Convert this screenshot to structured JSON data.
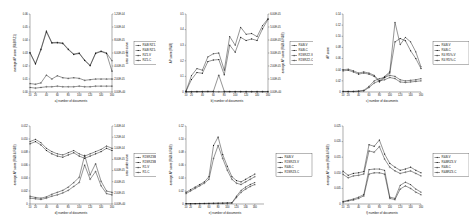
{
  "figure": {
    "layout": "2 rows x 3 columns of line plots",
    "rows": 2,
    "cols": 3
  },
  "common": {
    "xlabel_text": "number of documents",
    "xticks": [
      "10",
      "20",
      "40",
      "60",
      "80",
      "100",
      "120",
      "140",
      "160"
    ],
    "marker_colors": [
      "#111111",
      "#111111",
      "#111111",
      "#111111"
    ]
  },
  "chart_data": [
    {
      "id": "panel-a",
      "type": "line",
      "title": "",
      "caption": "a) number of documents",
      "xlabel": "a) number of documents",
      "ylabel": "average AP score (R&B RZ1)",
      "ylabel_right": "area under curve",
      "xlim": [
        10,
        160
      ],
      "ylim": [
        0,
        0.06
      ],
      "ylim_right": [
        0.0,
        0.00012
      ],
      "yticks": [
        "0.00",
        "0.01",
        "0.02",
        "0.03",
        "0.04",
        "0.05",
        "0.06"
      ],
      "yticks_right": [
        "0.00E+00",
        "2.00E-05",
        "4.00E-05",
        "6.00E-05",
        "8.00E-05",
        "1.00E-04",
        "1.20E-04"
      ],
      "grid": false,
      "legend_position": "right",
      "x": [
        10,
        20,
        30,
        40,
        50,
        60,
        70,
        80,
        90,
        100,
        110,
        120,
        130,
        140,
        150,
        160
      ],
      "series": [
        {
          "name": "R&B RZ1-V",
          "axis": "left",
          "values": [
            0.0305,
            0.0218,
            0.033,
            0.047,
            0.038,
            0.0382,
            0.0377,
            0.033,
            0.0292,
            0.03,
            0.0245,
            0.0205,
            0.03,
            0.0315,
            0.03,
            0.024
          ]
        },
        {
          "name": "R&B RZ1-C",
          "axis": "left",
          "values": [
            0.03,
            0.0215,
            0.0325,
            0.0462,
            0.0376,
            0.0378,
            0.0372,
            0.0326,
            0.0288,
            0.0296,
            0.0242,
            0.0202,
            0.0296,
            0.0311,
            0.0296,
            0.016
          ]
        },
        {
          "name": "RZ1-V",
          "axis": "right",
          "values": [
            1.3e-05,
            1.2e-05,
            1.4e-05,
            2.6e-05,
            2e-05,
            2.5e-05,
            2.2e-05,
            2.1e-05,
            2.2e-05,
            2.1e-05,
            1.8e-05,
            1.9e-05,
            2e-05,
            2e-05,
            2e-05,
            2e-05
          ]
        },
        {
          "name": "RZ1-C",
          "axis": "right",
          "values": [
            7e-06,
            6e-06,
            7e-06,
            8e-06,
            8e-06,
            9e-06,
            8e-06,
            8e-06,
            8e-06,
            9e-06,
            8e-06,
            8e-06,
            9e-06,
            9e-06,
            9e-06,
            9e-06
          ]
        }
      ]
    },
    {
      "id": "panel-b",
      "type": "line",
      "title": "",
      "caption": "b) number of documents",
      "xlabel": "b) number of documents",
      "ylabel": "AP score (R&B)",
      "ylabel_right": "average AP score (R&B & R&B)",
      "xlim": [
        10,
        160
      ],
      "ylim": [
        0,
        0.5
      ],
      "ylim_right": [
        0.0,
        6e-05
      ],
      "yticks": [
        "0",
        "0.1",
        "0.2",
        "0.3",
        "0.4",
        "0.5"
      ],
      "yticks_right": [
        "0.00E+00",
        "1.00E-05",
        "2.00E-05",
        "3.00E-05",
        "4.00E-05",
        "5.00E-05",
        "6.00E-05"
      ],
      "grid": false,
      "legend_position": "right",
      "x": [
        10,
        20,
        30,
        40,
        50,
        60,
        70,
        80,
        90,
        100,
        110,
        120,
        130,
        140,
        150,
        160
      ],
      "series": [
        {
          "name": "R&B-V",
          "axis": "left",
          "values": [
            0.005,
            0.105,
            0.15,
            0.14,
            0.225,
            0.245,
            0.25,
            0.14,
            0.355,
            0.3,
            0.415,
            0.37,
            0.375,
            0.355,
            0.425,
            0.47
          ]
        },
        {
          "name": "R&B-C",
          "axis": "left",
          "values": [
            0.005,
            0.08,
            0.125,
            0.12,
            0.195,
            0.205,
            0.208,
            0.11,
            0.3,
            0.255,
            0.35,
            0.33,
            0.34,
            0.33,
            0.405,
            0.465
          ]
        },
        {
          "name": "R1SRZ2-V",
          "axis": "right",
          "values": [
            2e-07,
            3e-07,
            4e-07,
            4e-07,
            5e-07,
            5e-07,
            1.3e-05,
            5e-07,
            4e-07,
            4e-07,
            4e-07,
            4e-07,
            4e-07,
            4e-07,
            4e-07,
            4e-07
          ]
        },
        {
          "name": "R1SRZ2-C",
          "axis": "right",
          "values": [
            1e-07,
            2e-07,
            2e-07,
            2e-07,
            3e-07,
            3e-07,
            2e-07,
            2e-07,
            2e-07,
            2e-07,
            2e-07,
            2e-07,
            2e-07,
            2e-07,
            2e-07,
            2e-07
          ]
        }
      ]
    },
    {
      "id": "panel-c",
      "type": "line",
      "title": "",
      "caption": "c) number of documents",
      "xlabel": "c) number of documents",
      "ylabel": "AP score",
      "xlim": [
        10,
        160
      ],
      "ylim": [
        0,
        0.14
      ],
      "yticks": [
        "0",
        "0.02",
        "0.04",
        "0.06",
        "0.08",
        "0.10",
        "0.12",
        "0.14"
      ],
      "grid": false,
      "legend_position": "right",
      "x": [
        10,
        20,
        30,
        40,
        50,
        60,
        70,
        80,
        90,
        100,
        110,
        120,
        130,
        140,
        150,
        160
      ],
      "series": [
        {
          "name": "R&B-V",
          "axis": "left",
          "values": [
            0.04,
            0.041,
            0.038,
            0.034,
            0.036,
            0.034,
            0.03,
            0.02,
            0.028,
            0.036,
            0.125,
            0.085,
            0.098,
            0.09,
            0.072,
            0.045
          ]
        },
        {
          "name": "R&B-C",
          "axis": "left",
          "values": [
            0.038,
            0.039,
            0.036,
            0.032,
            0.034,
            0.032,
            0.028,
            0.018,
            0.026,
            0.034,
            0.09,
            0.096,
            0.092,
            0.074,
            0.06,
            0.042
          ]
        },
        {
          "name": "R4 R5%-V",
          "axis": "left",
          "values": [
            0.001,
            0.001,
            0.001,
            0.002,
            0.003,
            0.01,
            0.02,
            0.024,
            0.026,
            0.03,
            0.028,
            0.022,
            0.02,
            0.021,
            0.022,
            0.024
          ]
        },
        {
          "name": "R4 R5%-C",
          "axis": "left",
          "values": [
            0.001,
            0.001,
            0.001,
            0.001,
            0.002,
            0.008,
            0.016,
            0.02,
            0.022,
            0.026,
            0.024,
            0.018,
            0.017,
            0.018,
            0.019,
            0.02
          ]
        }
      ]
    },
    {
      "id": "panel-d",
      "type": "line",
      "title": "",
      "caption": "d) number of documents",
      "xlabel": "d) number of documents",
      "ylabel": "average AP score (R&B & R&B)",
      "ylabel_right": "area under curve",
      "xlim": [
        10,
        160
      ],
      "ylim": [
        0,
        0.012
      ],
      "ylim_right": [
        0.0,
        0.00014
      ],
      "yticks": [
        "0",
        "0.002",
        "0.004",
        "0.006",
        "0.008",
        "0.010",
        "0.012"
      ],
      "yticks_right": [
        "0.00E+00",
        "2.00E-05",
        "4.00E-05",
        "6.00E-05",
        "8.00E-05",
        "1.00E-04",
        "1.20E-04",
        "1.40E-04"
      ],
      "grid": false,
      "legend_position": "right",
      "x": [
        10,
        20,
        30,
        40,
        50,
        60,
        70,
        80,
        90,
        100,
        110,
        120,
        130,
        140,
        150,
        160
      ],
      "series": [
        {
          "name": "R1SRZ3B-V",
          "axis": "right",
          "values": [
            0.000112,
            0.000116,
            0.00011,
            0.0001,
            9.4e-05,
            9e-05,
            8.8e-05,
            9.2e-05,
            9.6e-05,
            9e-05,
            8.6e-05,
            9e-05,
            9.4e-05,
            9.8e-05,
            0.000104,
            0.0001
          ]
        },
        {
          "name": "R1SRZ3B-C",
          "axis": "right",
          "values": [
            0.000108,
            0.000112,
            0.000106,
            9.6e-05,
            9e-05,
            8.6e-05,
            8.4e-05,
            8.8e-05,
            9.2e-05,
            8.6e-05,
            8.2e-05,
            8.6e-05,
            9e-05,
            9.4e-05,
            0.0001,
            9.6e-05
          ]
        },
        {
          "name": "R1-V",
          "axis": "left",
          "values": [
            0.0012,
            0.001,
            0.0009,
            0.0011,
            0.0015,
            0.0018,
            0.0021,
            0.0026,
            0.0033,
            0.0041,
            0.0075,
            0.0045,
            0.0062,
            0.0035,
            0.002,
            0.0018
          ]
        },
        {
          "name": "R1-C",
          "axis": "left",
          "values": [
            0.0009,
            0.0008,
            0.0007,
            0.0009,
            0.0012,
            0.0014,
            0.0017,
            0.0021,
            0.0027,
            0.0033,
            0.006,
            0.0038,
            0.005,
            0.0028,
            0.0016,
            0.0014
          ]
        }
      ]
    },
    {
      "id": "panel-e",
      "type": "line",
      "title": "",
      "caption": "e) number of documents",
      "xlabel": "e) number of documents",
      "ylabel": "average AP score (R&B & R&B)",
      "xlim": [
        10,
        180
      ],
      "ylim": [
        0,
        0.12
      ],
      "yticks": [
        "0",
        "0.02",
        "0.04",
        "0.06",
        "0.08",
        "0.10",
        "0.12"
      ],
      "grid": false,
      "legend_position": "right",
      "x": [
        10,
        20,
        30,
        40,
        50,
        60,
        70,
        80,
        90,
        100,
        110,
        120,
        130,
        140,
        150,
        160
      ],
      "series": [
        {
          "name": "R&B-V",
          "axis": "left",
          "values": [
            0.0005,
            0.0006,
            0.0007,
            0.0008,
            0.0009,
            0.001,
            0.0012,
            0.0013,
            0.0014,
            0.0016,
            0.0018,
            0.012,
            0.021,
            0.026,
            0.03,
            0.033
          ]
        },
        {
          "name": "R1SRZ3-V",
          "axis": "left",
          "values": [
            0.018,
            0.022,
            0.026,
            0.03,
            0.034,
            0.042,
            0.09,
            0.103,
            0.076,
            0.058,
            0.042,
            0.036,
            0.034,
            0.038,
            0.042,
            0.046
          ]
        },
        {
          "name": "R&B-C",
          "axis": "left",
          "values": [
            0.0004,
            0.0005,
            0.0006,
            0.0007,
            0.0008,
            0.0009,
            0.001,
            0.0011,
            0.0012,
            0.0014,
            0.0016,
            0.01,
            0.018,
            0.023,
            0.027,
            0.03
          ]
        },
        {
          "name": "R1SRZ3-C",
          "axis": "left",
          "values": [
            0.016,
            0.02,
            0.024,
            0.028,
            0.032,
            0.038,
            0.07,
            0.09,
            0.07,
            0.052,
            0.038,
            0.032,
            0.03,
            0.034,
            0.038,
            0.042
          ]
        }
      ]
    },
    {
      "id": "panel-f",
      "type": "line",
      "title": "",
      "caption": "f) number of documents",
      "xlabel": "f) number of documents",
      "ylabel": "average AP score (R&B & R&B)",
      "xlim": [
        10,
        160
      ],
      "ylim": [
        0,
        0.025
      ],
      "yticks": [
        "0",
        "0.005",
        "0.010",
        "0.015",
        "0.020",
        "0.025"
      ],
      "grid": false,
      "legend_position": "right",
      "x": [
        10,
        20,
        30,
        40,
        50,
        60,
        70,
        80,
        90,
        100,
        110,
        120,
        130,
        140,
        150,
        160
      ],
      "series": [
        {
          "name": "R&B-V",
          "axis": "left",
          "values": [
            0.0008,
            0.0012,
            0.0016,
            0.0022,
            0.003,
            0.011,
            0.0112,
            0.0112,
            0.0108,
            0.0022,
            0.0018,
            0.006,
            0.007,
            0.0062,
            0.0048,
            0.0038
          ]
        },
        {
          "name": "R&BRZ3-V",
          "axis": "left",
          "values": [
            0.0105,
            0.0092,
            0.0098,
            0.01,
            0.0104,
            0.019,
            0.0185,
            0.0205,
            0.016,
            0.013,
            0.0118,
            0.0108,
            0.0112,
            0.0118,
            0.0108,
            0.01
          ]
        },
        {
          "name": "R&B-C",
          "axis": "left",
          "values": [
            0.0006,
            0.001,
            0.0013,
            0.0018,
            0.0026,
            0.0096,
            0.01,
            0.01,
            0.0096,
            0.0018,
            0.0014,
            0.0048,
            0.0058,
            0.005,
            0.0038,
            0.003
          ]
        },
        {
          "name": "R&BRZ3-C",
          "axis": "left",
          "values": [
            0.0095,
            0.0084,
            0.009,
            0.0092,
            0.0096,
            0.017,
            0.0166,
            0.0184,
            0.0144,
            0.0118,
            0.0106,
            0.0098,
            0.0102,
            0.0106,
            0.0098,
            0.009
          ]
        }
      ]
    }
  ]
}
